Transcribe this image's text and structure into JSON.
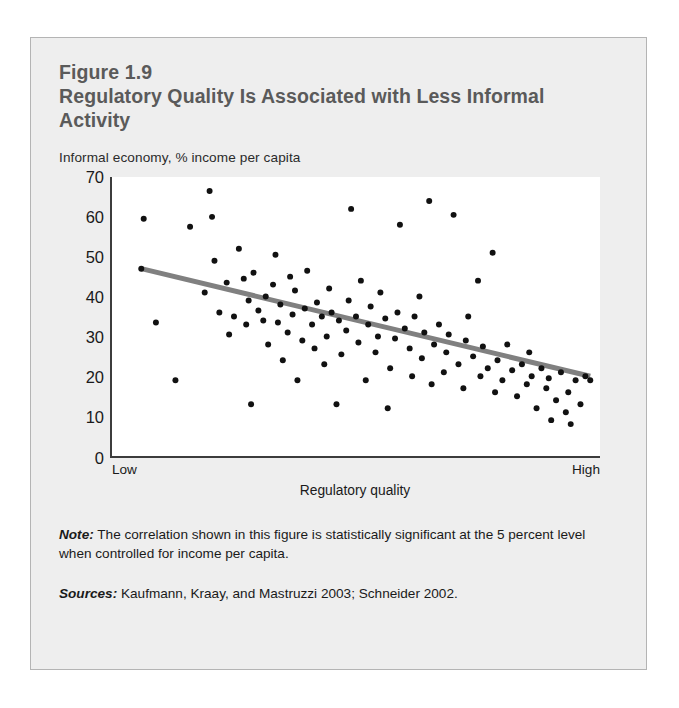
{
  "figure": {
    "number": "Figure 1.9",
    "title": "Regulatory Quality Is Associated with Less Informal Activity",
    "note_lead": "Note:",
    "note_text": " The correlation shown in this figure is statistically significant at the 5 percent level when controlled for income per capita.",
    "sources_lead": "Sources:",
    "sources_text": " Kaufmann, Kraay, and Mastruzzi 2003; Schneider 2002."
  },
  "colors": {
    "panel_background": "#eeeeee",
    "panel_border": "#b4b4b4",
    "title_text": "#5a5a5a",
    "body_text": "#1a1a1a",
    "plot_background": "#ffffff",
    "axis_line": "#3c3c3c",
    "point_fill": "#111111",
    "trendline": "#808080"
  },
  "chart_data": {
    "type": "scatter",
    "title": "Regulatory Quality Is Associated with Less Informal Activity",
    "subtitle": "Informal economy, % income per capita",
    "xlabel": "Regulatory quality",
    "ylabel": "Informal economy, % income per capita",
    "grid": false,
    "legend": null,
    "xlim": [
      0,
      100
    ],
    "ylim": [
      0,
      70
    ],
    "x_tick_labels": [
      "Low",
      "High"
    ],
    "y_ticks": [
      0,
      10,
      20,
      30,
      40,
      50,
      60,
      70
    ],
    "x_axis_is_ordinal_range": true,
    "trendline": {
      "type": "linear-fit",
      "x_start": 6,
      "y_start": 47,
      "x_end": 98,
      "y_end": 20,
      "color": "#808080",
      "width_px": 5
    },
    "points": [
      [
        6,
        47
      ],
      [
        6.5,
        59.5
      ],
      [
        9,
        33.5
      ],
      [
        13,
        19
      ],
      [
        16,
        57.5
      ],
      [
        19,
        41
      ],
      [
        20,
        66.5
      ],
      [
        20.5,
        60
      ],
      [
        21,
        49
      ],
      [
        22,
        36
      ],
      [
        23.5,
        43.5
      ],
      [
        24,
        30.5
      ],
      [
        25,
        35
      ],
      [
        26,
        52
      ],
      [
        27,
        44.5
      ],
      [
        27.5,
        33
      ],
      [
        28,
        39
      ],
      [
        28.5,
        13
      ],
      [
        29,
        46
      ],
      [
        30,
        36.5
      ],
      [
        31,
        34
      ],
      [
        31.5,
        40
      ],
      [
        32,
        28
      ],
      [
        33,
        43
      ],
      [
        33.5,
        50.5
      ],
      [
        34,
        33.5
      ],
      [
        34.5,
        38
      ],
      [
        35,
        24
      ],
      [
        36,
        31
      ],
      [
        36.5,
        45
      ],
      [
        37,
        35.5
      ],
      [
        37.5,
        41.5
      ],
      [
        38,
        19
      ],
      [
        39,
        29
      ],
      [
        39.5,
        37
      ],
      [
        40,
        46.5
      ],
      [
        41,
        33
      ],
      [
        41.5,
        27
      ],
      [
        42,
        38.5
      ],
      [
        43,
        35
      ],
      [
        43.5,
        23
      ],
      [
        44,
        30
      ],
      [
        44.5,
        42
      ],
      [
        45,
        36
      ],
      [
        46,
        13
      ],
      [
        46.5,
        34
      ],
      [
        47,
        25.5
      ],
      [
        48,
        31.5
      ],
      [
        48.5,
        39
      ],
      [
        49,
        62
      ],
      [
        50,
        35
      ],
      [
        50.5,
        28.5
      ],
      [
        51,
        44
      ],
      [
        52,
        19
      ],
      [
        52.5,
        33
      ],
      [
        53,
        37.5
      ],
      [
        54,
        26
      ],
      [
        54.5,
        30
      ],
      [
        55,
        41
      ],
      [
        56,
        34.5
      ],
      [
        56.5,
        12
      ],
      [
        57,
        22
      ],
      [
        58,
        29.5
      ],
      [
        58.5,
        36
      ],
      [
        59,
        58
      ],
      [
        60,
        32
      ],
      [
        61,
        27
      ],
      [
        61.5,
        20
      ],
      [
        62,
        35
      ],
      [
        63,
        40
      ],
      [
        63.5,
        24.5
      ],
      [
        64,
        31
      ],
      [
        65,
        64
      ],
      [
        65.5,
        18
      ],
      [
        66,
        28
      ],
      [
        67,
        33
      ],
      [
        68,
        21
      ],
      [
        68.5,
        26
      ],
      [
        69,
        30.5
      ],
      [
        70,
        60.5
      ],
      [
        71,
        23
      ],
      [
        72,
        17
      ],
      [
        72.5,
        29
      ],
      [
        73,
        35
      ],
      [
        74,
        25
      ],
      [
        75,
        44
      ],
      [
        75.5,
        20
      ],
      [
        76,
        27.5
      ],
      [
        77,
        22
      ],
      [
        78,
        51
      ],
      [
        78.5,
        16
      ],
      [
        79,
        24
      ],
      [
        80,
        19
      ],
      [
        81,
        28
      ],
      [
        82,
        21.5
      ],
      [
        83,
        15
      ],
      [
        84,
        23
      ],
      [
        85,
        18
      ],
      [
        85.5,
        26
      ],
      [
        86,
        20
      ],
      [
        87,
        12
      ],
      [
        88,
        22
      ],
      [
        89,
        17
      ],
      [
        89.5,
        19.5
      ],
      [
        90,
        9
      ],
      [
        91,
        14
      ],
      [
        92,
        21
      ],
      [
        93,
        11
      ],
      [
        93.5,
        16
      ],
      [
        94,
        8
      ],
      [
        95,
        19
      ],
      [
        96,
        13
      ],
      [
        97,
        20
      ],
      [
        98,
        19
      ]
    ]
  }
}
